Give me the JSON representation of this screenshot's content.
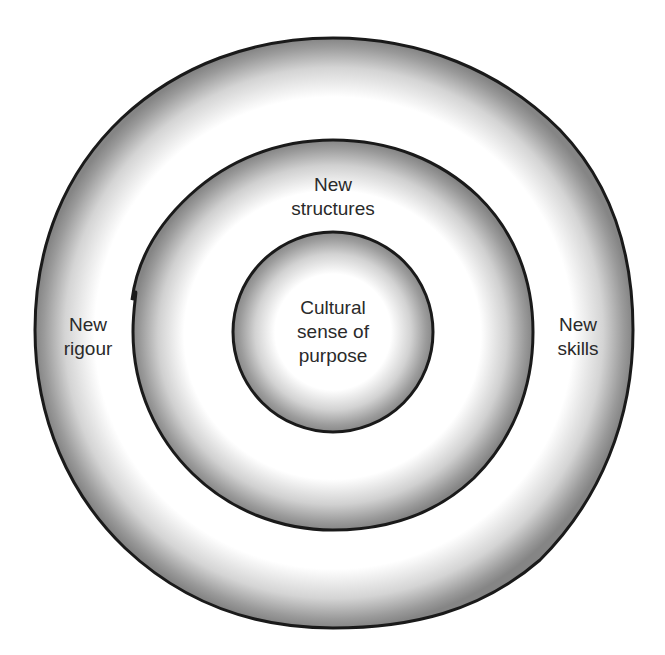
{
  "diagram": {
    "type": "concentric-circles",
    "center": {
      "x": 333,
      "y": 333
    },
    "rings": [
      {
        "id": "outer",
        "radius": 298,
        "label": "New rigour / New skills"
      },
      {
        "id": "middle",
        "radius": 198,
        "label": "New structures"
      },
      {
        "id": "inner",
        "radius": 100,
        "label": "Cultural sense of purpose"
      }
    ],
    "colors": {
      "outline": "#1a1a1a",
      "shade_dark": "#8c8c8c",
      "shade_light": "#ffffff",
      "text": "#2a2a2a"
    }
  },
  "labels": {
    "inner": "Cultural\nsense of\npurpose",
    "middle_top": "New\nstructures",
    "outer_left": "New\nrigour",
    "outer_right": "New\nskills"
  }
}
